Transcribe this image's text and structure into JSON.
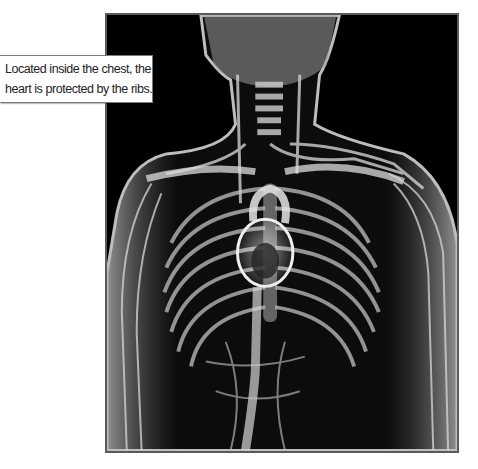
{
  "figure": {
    "colors": {
      "background": "#000000",
      "border": "#5a5a5a",
      "structure": "#d8d8d8"
    }
  },
  "callout": {
    "lines": [
      "Located inside the chest, the",
      "heart is protected by the ribs."
    ]
  }
}
